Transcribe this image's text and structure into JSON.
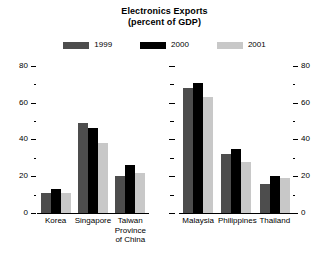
{
  "title": {
    "line1": "Electronics Exports",
    "line2": "(percent of GDP)"
  },
  "legend": {
    "position": "top-center",
    "items": [
      {
        "label": "1999",
        "color": "#4d4d4d",
        "swatch_name": "legend-swatch-1999"
      },
      {
        "label": "2000",
        "color": "#000000",
        "swatch_name": "legend-swatch-2000"
      },
      {
        "label": "2001",
        "color": "#c8c8c8",
        "swatch_name": "legend-swatch-2001"
      }
    ]
  },
  "axis": {
    "ticks_major": [
      "0",
      "20",
      "40",
      "60",
      "80"
    ],
    "min": 0,
    "max": 80,
    "minor_step": 10
  },
  "chart_data": {
    "type": "bar",
    "title": "Electronics Exports (percent of GDP)",
    "subtitle": "(percent of GDP)",
    "xlabel": "",
    "ylabel": "",
    "ylim": [
      0,
      80
    ],
    "yticks": [
      0,
      20,
      40,
      60,
      80
    ],
    "grid": false,
    "legend_position": "top-center",
    "panels": [
      {
        "name": "left-panel",
        "categories": [
          "Korea",
          "Singapore",
          "Taiwan Province of China"
        ],
        "category_lines": [
          [
            "Korea"
          ],
          [
            "Singapore"
          ],
          [
            "Taiwan",
            "Province",
            "of China"
          ]
        ],
        "series": [
          {
            "name": "1999",
            "color": "#4d4d4d",
            "values": [
              11,
              49,
              20
            ]
          },
          {
            "name": "2000",
            "color": "#000000",
            "values": [
              13,
              46,
              26
            ]
          },
          {
            "name": "2001",
            "color": "#c8c8c8",
            "values": [
              11,
              38,
              22
            ]
          }
        ]
      },
      {
        "name": "right-panel",
        "categories": [
          "Malaysia",
          "Philippines",
          "Thailand"
        ],
        "category_lines": [
          [
            "Malaysia"
          ],
          [
            "Philippines"
          ],
          [
            "Thailand"
          ]
        ],
        "series": [
          {
            "name": "1999",
            "color": "#4d4d4d",
            "values": [
              68,
              32,
              16
            ]
          },
          {
            "name": "2000",
            "color": "#000000",
            "values": [
              71,
              35,
              20
            ]
          },
          {
            "name": "2001",
            "color": "#c8c8c8",
            "values": [
              63,
              28,
              19
            ]
          }
        ]
      }
    ]
  }
}
